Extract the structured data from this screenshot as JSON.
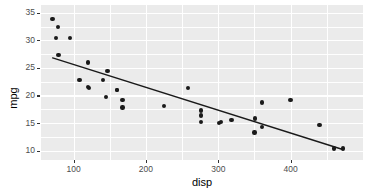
{
  "chart_data": {
    "type": "scatter",
    "title": "",
    "subtitle": "",
    "xlabel": "disp",
    "ylabel": "mpg",
    "xlim": [
      55,
      500
    ],
    "ylim": [
      8.3,
      36.4
    ],
    "xticks": [
      100,
      200,
      300,
      400
    ],
    "xtick_labels": [
      "100",
      "200",
      "300",
      "400"
    ],
    "yticks": [
      10,
      15,
      20,
      25,
      30,
      35
    ],
    "ytick_labels": [
      "10",
      "15",
      "20",
      "25",
      "30",
      "35"
    ],
    "x_minor_ticks": [
      150,
      250,
      350,
      450
    ],
    "y_minor_ticks": [
      12.5,
      17.5,
      22.5,
      27.5,
      32.5
    ],
    "grid": true,
    "legend": "none",
    "panel_background": "#ebebeb",
    "gridline_color": "#ffffff",
    "point_color": "#1a1a1a",
    "line_color": "#1a1a1a",
    "point_size": 4.4,
    "series": [
      {
        "name": "mtcars",
        "marker": "filled-circle",
        "points": [
          {
            "x": 160.0,
            "y": 21.0
          },
          {
            "x": 160.0,
            "y": 21.0
          },
          {
            "x": 108.0,
            "y": 22.8
          },
          {
            "x": 258.0,
            "y": 21.4
          },
          {
            "x": 360.0,
            "y": 18.7
          },
          {
            "x": 225.0,
            "y": 18.1
          },
          {
            "x": 360.0,
            "y": 14.3
          },
          {
            "x": 146.7,
            "y": 24.4
          },
          {
            "x": 140.8,
            "y": 22.8
          },
          {
            "x": 167.6,
            "y": 19.2
          },
          {
            "x": 167.6,
            "y": 17.8
          },
          {
            "x": 275.8,
            "y": 16.4
          },
          {
            "x": 275.8,
            "y": 17.3
          },
          {
            "x": 275.8,
            "y": 15.2
          },
          {
            "x": 472.0,
            "y": 10.4
          },
          {
            "x": 460.0,
            "y": 10.4
          },
          {
            "x": 440.0,
            "y": 14.7
          },
          {
            "x": 78.7,
            "y": 32.4
          },
          {
            "x": 75.7,
            "y": 30.4
          },
          {
            "x": 71.1,
            "y": 33.9
          },
          {
            "x": 120.1,
            "y": 21.5
          },
          {
            "x": 318.0,
            "y": 15.5
          },
          {
            "x": 304.0,
            "y": 15.2
          },
          {
            "x": 350.0,
            "y": 13.3
          },
          {
            "x": 400.0,
            "y": 19.2
          },
          {
            "x": 79.0,
            "y": 27.3
          },
          {
            "x": 120.3,
            "y": 26.0
          },
          {
            "x": 95.1,
            "y": 30.4
          },
          {
            "x": 351.0,
            "y": 15.8
          },
          {
            "x": 145.0,
            "y": 19.7
          },
          {
            "x": 301.0,
            "y": 15.0
          },
          {
            "x": 121.0,
            "y": 21.4
          }
        ]
      }
    ],
    "fit_line": {
      "type": "linear-regression",
      "label": "lm fit",
      "x_start": 71.1,
      "y_start": 26.8,
      "x_end": 472.0,
      "y_end": 10.2,
      "slope": -0.0412,
      "intercept": 29.73
    }
  }
}
